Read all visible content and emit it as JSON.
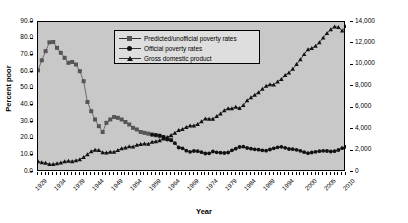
{
  "chart_data": {
    "type": "line",
    "title": "",
    "xlabel": "Year",
    "ylabel": "Percent poor",
    "y2label": "GDP (in billions, 2005 dollars)",
    "grid": false,
    "legend_position": "top-center-inside",
    "xlim": [
      1929,
      2010
    ],
    "ylim": [
      0,
      90
    ],
    "y2lim": [
      0,
      14000
    ],
    "yticks": [
      "0.0",
      "10.0",
      "20.0",
      "30.0",
      "40.0",
      "50.0",
      "60.0",
      "70.0",
      "80.0",
      "90.0"
    ],
    "y2ticks": [
      "0",
      "2,000",
      "4,000",
      "6,000",
      "8,000",
      "10,000",
      "12,000",
      "14,000"
    ],
    "xticks": [
      "1929",
      "1934",
      "1939",
      "1944",
      "1949",
      "1954",
      "1959",
      "1964",
      "1969",
      "1974",
      "1979",
      "1984",
      "1989",
      "1994",
      "2000",
      "2005",
      "2010"
    ],
    "x": [
      1929,
      1930,
      1931,
      1932,
      1933,
      1934,
      1935,
      1936,
      1937,
      1938,
      1939,
      1940,
      1941,
      1942,
      1943,
      1944,
      1945,
      1946,
      1947,
      1948,
      1949,
      1950,
      1951,
      1952,
      1953,
      1954,
      1955,
      1956,
      1957,
      1958,
      1959,
      1960,
      1961,
      1962,
      1963,
      1964,
      1965,
      1966,
      1967,
      1968,
      1969,
      1970,
      1971,
      1972,
      1973,
      1974,
      1975,
      1976,
      1977,
      1978,
      1979,
      1980,
      1981,
      1982,
      1983,
      1984,
      1985,
      1986,
      1987,
      1988,
      1989,
      1990,
      1991,
      1992,
      1993,
      1994,
      1995,
      1996,
      1997,
      1998,
      1999,
      2000,
      2001,
      2002,
      2003,
      2004,
      2005,
      2006,
      2007,
      2008,
      2009,
      2010
    ],
    "series": [
      {
        "name": "Predicted/unofficial poverty rates",
        "marker": "square",
        "color": "#555555",
        "x": [
          1929,
          1930,
          1931,
          1932,
          1933,
          1934,
          1935,
          1936,
          1937,
          1938,
          1939,
          1940,
          1941,
          1942,
          1943,
          1944,
          1945,
          1946,
          1947,
          1948,
          1949,
          1950,
          1951,
          1952,
          1953,
          1954,
          1955,
          1956,
          1957,
          1958,
          1959,
          1960,
          1961,
          1962,
          1963,
          1964
        ],
        "values": [
          61.0,
          67.0,
          72.5,
          77.8,
          78.0,
          74.5,
          71.5,
          68.5,
          65.5,
          66.0,
          64.5,
          60.5,
          54.5,
          42.0,
          36.5,
          31.5,
          27.5,
          24.0,
          29.5,
          31.5,
          33.0,
          32.5,
          31.5,
          30.0,
          28.5,
          26.5,
          25.5,
          24.0,
          23.5,
          23.0,
          22.5,
          22.0,
          21.5,
          21.0,
          20.0,
          19.5
        ]
      },
      {
        "name": "Official poverty rates",
        "marker": "circle",
        "color": "#111111",
        "x": [
          1959,
          1960,
          1961,
          1962,
          1963,
          1964,
          1965,
          1966,
          1967,
          1968,
          1969,
          1970,
          1971,
          1972,
          1973,
          1974,
          1975,
          1976,
          1977,
          1978,
          1979,
          1980,
          1981,
          1982,
          1983,
          1984,
          1985,
          1986,
          1987,
          1988,
          1989,
          1990,
          1991,
          1992,
          1993,
          1994,
          1995,
          1996,
          1997,
          1998,
          1999,
          2000,
          2001,
          2002,
          2003,
          2004,
          2005,
          2006,
          2007,
          2008,
          2009,
          2010
        ],
        "values": [
          22.4,
          22.2,
          21.9,
          21.0,
          19.5,
          19.0,
          17.3,
          14.7,
          14.2,
          12.8,
          12.1,
          12.6,
          12.5,
          11.9,
          11.1,
          11.2,
          12.3,
          11.8,
          11.6,
          11.4,
          11.7,
          13.0,
          14.0,
          15.0,
          15.2,
          14.4,
          14.0,
          13.6,
          13.4,
          13.0,
          12.8,
          13.5,
          14.2,
          14.8,
          15.1,
          14.5,
          13.8,
          13.7,
          13.3,
          12.7,
          11.9,
          11.3,
          11.7,
          12.1,
          12.5,
          12.7,
          12.6,
          12.3,
          12.5,
          13.2,
          14.3,
          15.1
        ]
      },
      {
        "name": "Gross domestic product",
        "marker": "triangle",
        "color": "#111111",
        "x": [
          1929,
          1930,
          1931,
          1932,
          1933,
          1934,
          1935,
          1936,
          1937,
          1938,
          1939,
          1940,
          1941,
          1942,
          1943,
          1944,
          1945,
          1946,
          1947,
          1948,
          1949,
          1950,
          1951,
          1952,
          1953,
          1954,
          1955,
          1956,
          1957,
          1958,
          1959,
          1960,
          1961,
          1962,
          1963,
          1964,
          1965,
          1966,
          1967,
          1968,
          1969,
          1970,
          1971,
          1972,
          1973,
          1974,
          1975,
          1976,
          1977,
          1978,
          1979,
          1980,
          1981,
          1982,
          1983,
          1984,
          1985,
          1986,
          1987,
          1988,
          1989,
          1990,
          1991,
          1992,
          1993,
          1994,
          1995,
          1996,
          1997,
          1998,
          1999,
          2000,
          2001,
          2002,
          2003,
          2004,
          2005,
          2006,
          2007,
          2008,
          2009,
          2010
        ],
        "values": [
          977,
          894,
          836,
          728,
          718,
          796,
          867,
          980,
          1031,
          996,
          1077,
          1170,
          1377,
          1636,
          1913,
          2065,
          2045,
          1816,
          1797,
          1871,
          1863,
          2026,
          2189,
          2276,
          2382,
          2367,
          2533,
          2587,
          2637,
          2613,
          2794,
          2863,
          2935,
          3112,
          3247,
          3435,
          3655,
          3896,
          3997,
          4190,
          4322,
          4330,
          4472,
          4709,
          4980,
          4954,
          4945,
          5212,
          5452,
          5755,
          5938,
          5925,
          6074,
          5956,
          6228,
          6673,
          6952,
          7202,
          7434,
          7743,
          8023,
          8168,
          8155,
          8434,
          8666,
          9026,
          9270,
          9622,
          10056,
          10500,
          10999,
          11444,
          11557,
          11762,
          12089,
          12544,
          12949,
          13305,
          13571,
          13509,
          13180,
          13598
        ]
      }
    ]
  },
  "legend": {
    "items": [
      {
        "label": "Predicted/unofficial poverty rates",
        "marker": "square"
      },
      {
        "label": "Official poverty rates",
        "marker": "circle"
      },
      {
        "label": "Gross domestic product",
        "marker": "triangle"
      }
    ]
  }
}
